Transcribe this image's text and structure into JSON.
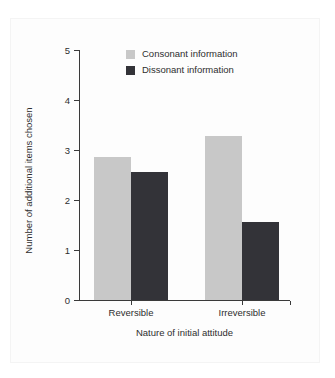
{
  "chart_data": {
    "type": "bar",
    "title": "",
    "subtitle": "",
    "xlabel": "Nature of initial attitude",
    "ylabel": "Number of additional items chosen",
    "categories": [
      "Reversible",
      "Irreversible"
    ],
    "series": [
      {
        "name": "Consonant information",
        "color": "#c8c8c8",
        "values": [
          2.86,
          3.28
        ]
      },
      {
        "name": "Dissonant information",
        "color": "#333338",
        "values": [
          2.56,
          1.56
        ]
      }
    ],
    "ylim": [
      0,
      5
    ],
    "ytick_labels": [
      "0",
      "1",
      "2",
      "3",
      "4",
      "5"
    ],
    "ytick_values": [
      0,
      1,
      2,
      3,
      4,
      5
    ],
    "grid": false,
    "legend_position": "top-center",
    "legend_frame": false,
    "background_color": "#ffffff",
    "axis_color": "#3a3a3a"
  },
  "legend": {
    "entries": [
      {
        "label": "Consonant information"
      },
      {
        "label": "Dissonant information"
      }
    ]
  }
}
